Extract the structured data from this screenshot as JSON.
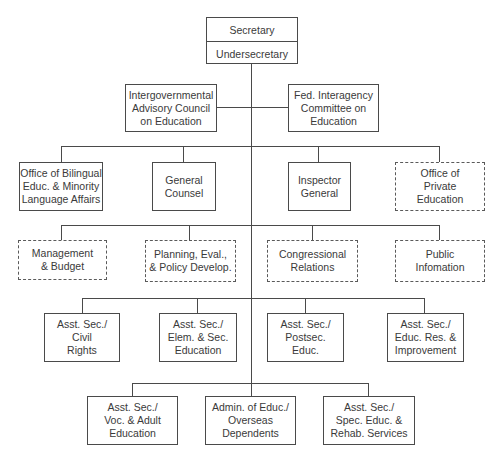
{
  "chart": {
    "top": {
      "secretary": "Secretary",
      "undersecretary": "Undersecretary"
    },
    "advisory": [
      {
        "label": "Intergovernmental\nAdvisory Council\non Education",
        "style": "solid"
      },
      {
        "label": "Fed. Interagency\nCommittee on\nEducation",
        "style": "solid"
      }
    ],
    "offices": [
      {
        "label": "Office of Bilingual\nEduc. & Minority\nLanguage Affairs",
        "style": "solid"
      },
      {
        "label": "General\nCounsel",
        "style": "solid"
      },
      {
        "label": "Inspector\nGeneral",
        "style": "solid"
      },
      {
        "label": "Office of\nPrivate\nEducation",
        "style": "dashed"
      }
    ],
    "staff": [
      {
        "label": "Management\n& Budget",
        "style": "dashed"
      },
      {
        "label": "Planning, Eval.,\n& Policy Develop.",
        "style": "dashed"
      },
      {
        "label": "Congressional\nRelations",
        "style": "dashed"
      },
      {
        "label": "Public\nInfomation",
        "style": "dashed"
      }
    ],
    "assistants_row1": [
      {
        "label": "Asst. Sec./\nCivil\nRights",
        "style": "solid"
      },
      {
        "label": "Asst. Sec./\nElem. & Sec.\nEducation",
        "style": "solid"
      },
      {
        "label": "Asst. Sec./\nPostsec.\nEduc.",
        "style": "solid"
      },
      {
        "label": "Asst. Sec./\nEduc. Res. &\nImprovement",
        "style": "solid"
      }
    ],
    "assistants_row2": [
      {
        "label": "Asst. Sec./\nVoc. & Adult\nEducation",
        "style": "solid"
      },
      {
        "label": "Admin. of Educ./\nOverseas\nDependents",
        "style": "solid"
      },
      {
        "label": "Asst. Sec./\nSpec. Educ. &\nRehab. Services",
        "style": "solid"
      }
    ]
  },
  "colors": {
    "line": "#4a4a4a",
    "text": "#3a3a3a",
    "background": "#ffffff"
  }
}
